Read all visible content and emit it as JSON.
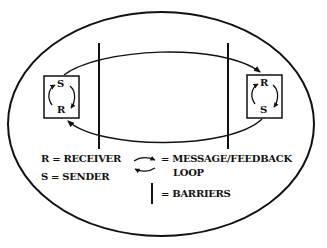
{
  "diagram": {
    "title": "",
    "nodes": [
      {
        "id": "left-box",
        "top_letter": "S",
        "bottom_letter": "R"
      },
      {
        "id": "right-box",
        "top_letter": "R",
        "bottom_letter": "S"
      }
    ],
    "barriers": 2,
    "legend": {
      "receiver": "R = RECEIVER",
      "sender": "S = SENDER",
      "loop_line1": "= MESSAGE/FEEDBACK",
      "loop_line2": "LOOP",
      "barriers": "= BARRIERS"
    },
    "colors": {
      "ink": "#111111",
      "background": "#ffffff"
    }
  }
}
